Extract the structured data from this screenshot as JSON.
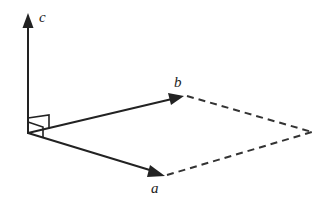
{
  "diagram": {
    "type": "vector-parallelogram",
    "colors": {
      "stroke": "#222222",
      "background": "#ffffff"
    },
    "origin": [
      28,
      133
    ],
    "vectors": [
      {
        "name": "a",
        "label": "a",
        "tip": [
          164,
          176
        ]
      },
      {
        "name": "b",
        "label": "b",
        "tip": [
          183,
          96
        ]
      },
      {
        "name": "c",
        "label": "c",
        "tip": [
          28,
          14
        ]
      }
    ],
    "dashed_corner": [
      312,
      132
    ],
    "right_angle_marks": 2
  }
}
